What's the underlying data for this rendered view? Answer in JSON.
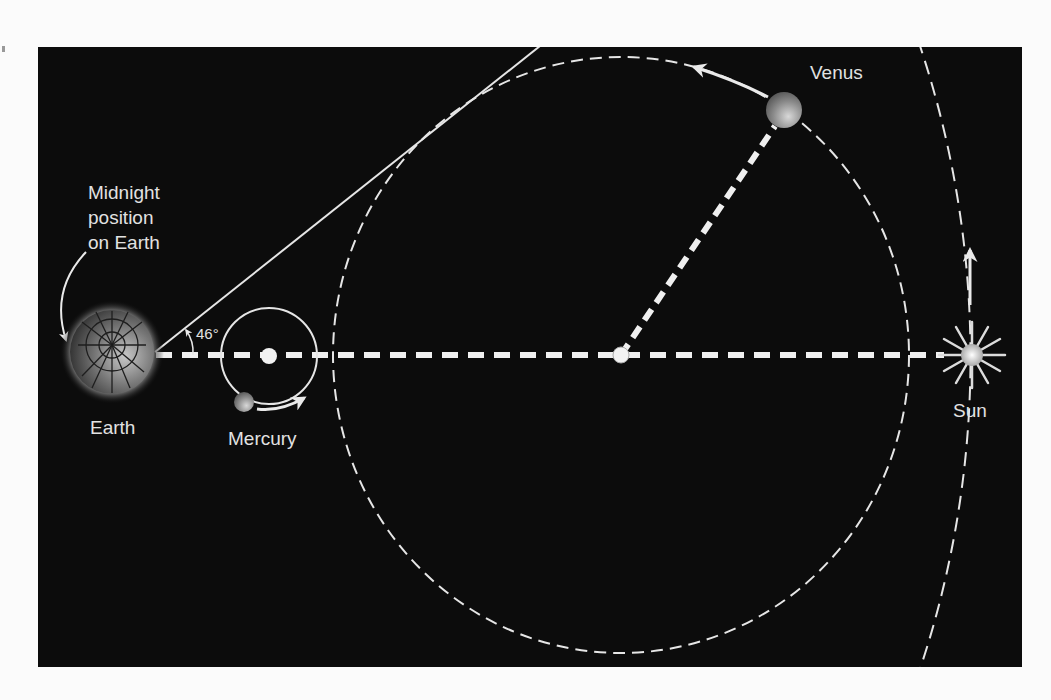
{
  "figure": {
    "title": "",
    "background_color": "#0c0c0c",
    "labels": {
      "midnight": [
        "Midnight",
        "position",
        "on Earth"
      ],
      "earth": "Earth",
      "mercury": "Mercury",
      "venus": "Venus",
      "sun": "Sun",
      "angle": "46°"
    },
    "bodies": [
      {
        "name": "Earth",
        "cx": 112,
        "cy": 352,
        "r": 42
      },
      {
        "name": "Mercury",
        "cx": 244,
        "cy": 402,
        "r": 10
      },
      {
        "name": "Venus",
        "cx": 784,
        "cy": 110,
        "r": 18
      },
      {
        "name": "Sun",
        "cx": 972,
        "cy": 355,
        "r": 10
      }
    ],
    "orbits": [
      {
        "name": "Mercury orbit",
        "center": [
          269,
          356
        ],
        "r": 48,
        "style": "solid"
      },
      {
        "name": "Venus orbit",
        "center": [
          621,
          355
        ],
        "rx": 288,
        "ry": 298,
        "style": "dashed"
      },
      {
        "name": "Earth orbit",
        "style": "dashed arc"
      }
    ],
    "annotations": {
      "elongation_angle_deg": 46,
      "tangent_line": "Earth to Venus orbit tangent",
      "sun_earth_line": "dashed"
    }
  }
}
